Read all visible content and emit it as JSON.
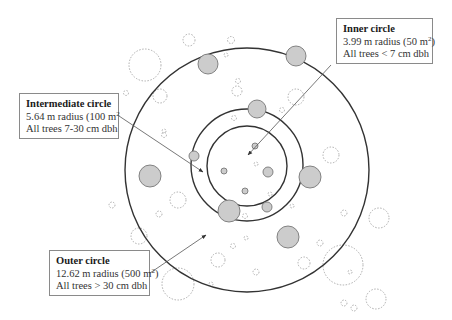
{
  "diagram": {
    "plots": {
      "outer": {
        "cx": 247,
        "cy": 170,
        "r": 122
      },
      "intermediate": {
        "cx": 247,
        "cy": 165,
        "r": 56
      },
      "inner": {
        "cx": 247,
        "cy": 166,
        "r": 40
      }
    },
    "colors": {
      "plot_line": "#333333",
      "tree_fill": "#cccccc",
      "tree_stroke": "#777777",
      "dashed_tree": "#999999",
      "arrow": "#555555",
      "box_border": "#8a8a8a"
    },
    "labels": {
      "inner": {
        "title": "Inner circle",
        "radius_prefix": "3.99 m radius (50 m",
        "radius_sup": "2",
        "radius_suffix": ")",
        "criteria": "All trees < 7 cm dbh"
      },
      "intermediate": {
        "title": "Intermediate circle",
        "radius_prefix": "5.64 m radius (100 m",
        "radius_sup": "2",
        "radius_suffix": "",
        "criteria": "All trees 7-30 cm dbh"
      },
      "outer": {
        "title": "Outer circle",
        "radius_prefix": "12.62 m radius (500 m",
        "radius_sup": "2",
        "radius_suffix": ")",
        "criteria": "All trees > 30 cm dbh"
      }
    },
    "arrows": [
      {
        "name": "inner-arrow",
        "x1": 331,
        "y1": 65,
        "x2": 248,
        "y2": 155
      },
      {
        "name": "intermediate-arrow",
        "x1": 119,
        "y1": 116,
        "x2": 203,
        "y2": 172
      },
      {
        "name": "outer-arrow",
        "x1": 150,
        "y1": 273,
        "x2": 206,
        "y2": 235
      }
    ],
    "measured_trees": [
      {
        "cx": 208,
        "cy": 64,
        "r": 10
      },
      {
        "cx": 296,
        "cy": 56,
        "r": 10
      },
      {
        "cx": 257,
        "cy": 109,
        "r": 9
      },
      {
        "cx": 194,
        "cy": 156,
        "r": 5
      },
      {
        "cx": 150,
        "cy": 176,
        "r": 11
      },
      {
        "cx": 310,
        "cy": 177,
        "r": 11
      },
      {
        "cx": 229,
        "cy": 211,
        "r": 11
      },
      {
        "cx": 267,
        "cy": 207,
        "r": 5
      },
      {
        "cx": 288,
        "cy": 237,
        "r": 11
      },
      {
        "cx": 268,
        "cy": 172,
        "r": 5
      },
      {
        "cx": 255,
        "cy": 146,
        "r": 3
      },
      {
        "cx": 224,
        "cy": 171,
        "r": 3
      },
      {
        "cx": 245,
        "cy": 191,
        "r": 3
      }
    ],
    "unmeasured_trees": [
      {
        "cx": 189,
        "cy": 40,
        "r": 6
      },
      {
        "cx": 145,
        "cy": 65,
        "r": 16
      },
      {
        "cx": 160,
        "cy": 96,
        "r": 7
      },
      {
        "cx": 126,
        "cy": 93,
        "r": 2.5
      },
      {
        "cx": 231,
        "cy": 40,
        "r": 3.5
      },
      {
        "cx": 226,
        "cy": 55,
        "r": 2
      },
      {
        "cx": 238,
        "cy": 81,
        "r": 2.5
      },
      {
        "cx": 237,
        "cy": 91,
        "r": 5
      },
      {
        "cx": 296,
        "cy": 97,
        "r": 8
      },
      {
        "cx": 282,
        "cy": 110,
        "r": 2.5
      },
      {
        "cx": 234,
        "cy": 118,
        "r": 2.5
      },
      {
        "cx": 164,
        "cy": 135,
        "r": 2.5
      },
      {
        "cx": 331,
        "cy": 155,
        "r": 8
      },
      {
        "cx": 164,
        "cy": 131,
        "r": 2
      },
      {
        "cx": 178,
        "cy": 200,
        "r": 8
      },
      {
        "cx": 159,
        "cy": 214,
        "r": 3
      },
      {
        "cx": 112,
        "cy": 205,
        "r": 3
      },
      {
        "cx": 139,
        "cy": 236,
        "r": 8
      },
      {
        "cx": 218,
        "cy": 260,
        "r": 7
      },
      {
        "cx": 246,
        "cy": 238,
        "r": 2
      },
      {
        "cx": 233,
        "cy": 246,
        "r": 2.5
      },
      {
        "cx": 256,
        "cy": 272,
        "r": 3
      },
      {
        "cx": 270,
        "cy": 194,
        "r": 2
      },
      {
        "cx": 245,
        "cy": 216,
        "r": 2.5
      },
      {
        "cx": 304,
        "cy": 263,
        "r": 6
      },
      {
        "cx": 320,
        "cy": 243,
        "r": 3
      },
      {
        "cx": 343,
        "cy": 265,
        "r": 20
      },
      {
        "cx": 344,
        "cy": 213,
        "r": 3
      },
      {
        "cx": 379,
        "cy": 218,
        "r": 10
      },
      {
        "cx": 350,
        "cy": 272,
        "r": 2
      },
      {
        "cx": 376,
        "cy": 299,
        "r": 10
      },
      {
        "cx": 344,
        "cy": 303,
        "r": 3
      },
      {
        "cx": 354,
        "cy": 308,
        "r": 3
      },
      {
        "cx": 178,
        "cy": 284,
        "r": 16
      },
      {
        "cx": 211,
        "cy": 284,
        "r": 2
      },
      {
        "cx": 256,
        "cy": 164,
        "r": 2
      },
      {
        "cx": 292,
        "cy": 206,
        "r": 2
      }
    ]
  }
}
